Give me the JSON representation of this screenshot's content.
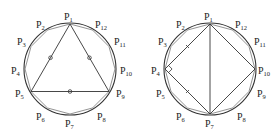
{
  "figures": [
    {
      "id": "left",
      "center": [
        70,
        69
      ],
      "radius": 46,
      "polygon": "triangle",
      "vertices": [
        "P1",
        "P5",
        "P9"
      ],
      "mark": "circle",
      "labels": [
        {
          "name": "P",
          "sub": "1",
          "x": 64,
          "y": 20
        },
        {
          "name": "P",
          "sub": "2",
          "x": 36,
          "y": 28
        },
        {
          "name": "P",
          "sub": "3",
          "x": 17,
          "y": 45
        },
        {
          "name": "P",
          "sub": "4",
          "x": 11,
          "y": 74
        },
        {
          "name": "P",
          "sub": "5",
          "x": 15,
          "y": 97
        },
        {
          "name": "P",
          "sub": "6",
          "x": 36,
          "y": 120
        },
        {
          "name": "P",
          "sub": "7",
          "x": 65,
          "y": 127
        },
        {
          "name": "P",
          "sub": "8",
          "x": 97,
          "y": 120
        },
        {
          "name": "P",
          "sub": "9",
          "x": 116,
          "y": 97
        },
        {
          "name": "P",
          "sub": "10",
          "x": 120,
          "y": 74
        },
        {
          "name": "P",
          "sub": "11",
          "x": 114,
          "y": 45
        },
        {
          "name": "P",
          "sub": "12",
          "x": 95,
          "y": 28
        }
      ]
    },
    {
      "id": "right",
      "center": [
        210,
        69
      ],
      "radius": 46,
      "polygon": "quadrilateral",
      "vertices": [
        "P1",
        "P4",
        "P7",
        "P10"
      ],
      "diagonal": [
        "P1",
        "P7"
      ],
      "mark": "right-angle",
      "labels": [
        {
          "name": "P",
          "sub": "1",
          "x": 204,
          "y": 20
        },
        {
          "name": "P",
          "sub": "2",
          "x": 176,
          "y": 28
        },
        {
          "name": "P",
          "sub": "3",
          "x": 158,
          "y": 45
        },
        {
          "name": "P",
          "sub": "4",
          "x": 151,
          "y": 74
        },
        {
          "name": "P",
          "sub": "5",
          "x": 156,
          "y": 97
        },
        {
          "name": "P",
          "sub": "6",
          "x": 176,
          "y": 120
        },
        {
          "name": "P",
          "sub": "7",
          "x": 205,
          "y": 127
        },
        {
          "name": "P",
          "sub": "8",
          "x": 237,
          "y": 120
        },
        {
          "name": "P",
          "sub": "9",
          "x": 257,
          "y": 97
        },
        {
          "name": "P",
          "sub": "10",
          "x": 258,
          "y": 74
        },
        {
          "name": "P",
          "sub": "11",
          "x": 254,
          "y": 45
        },
        {
          "name": "P",
          "sub": "12",
          "x": 235,
          "y": 28
        }
      ]
    }
  ]
}
